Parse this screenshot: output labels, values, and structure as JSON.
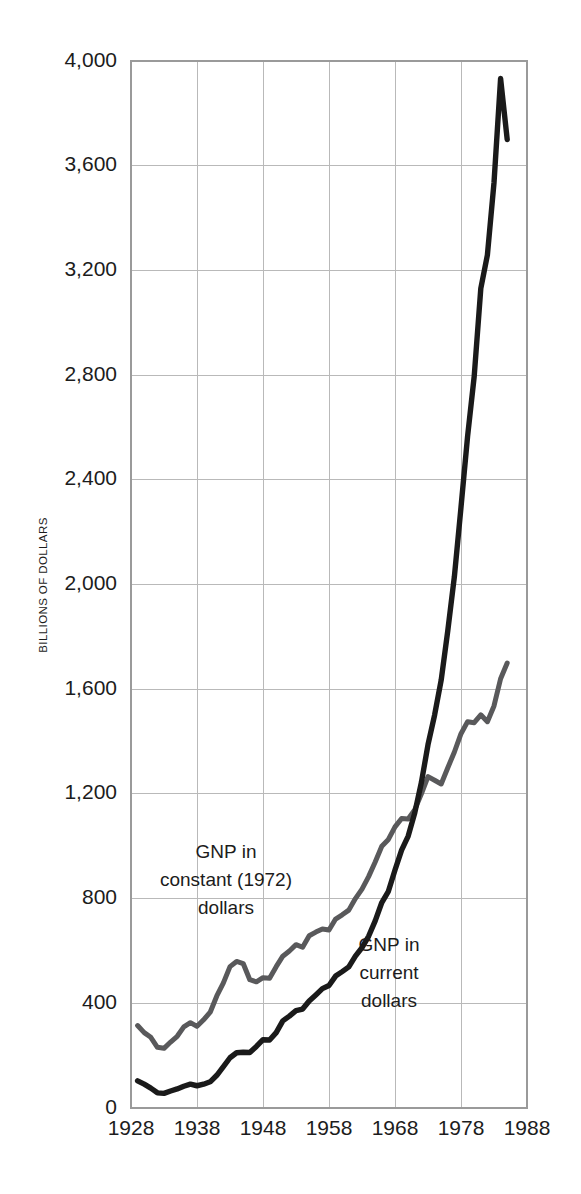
{
  "chart_data": {
    "type": "line",
    "title": "",
    "xlabel": "",
    "ylabel": "BILLIONS OF DOLLARS",
    "xlim": [
      1928,
      1988
    ],
    "ylim": [
      0,
      4000
    ],
    "xticks": [
      1928,
      1938,
      1948,
      1958,
      1968,
      1978,
      1988
    ],
    "xticklabels": [
      "1928",
      "1938",
      "1948",
      "1958",
      "1968",
      "1978",
      "1988"
    ],
    "yticks": [
      0,
      400,
      800,
      1200,
      1600,
      2000,
      2400,
      2800,
      3200,
      3600,
      4000
    ],
    "yticklabels": [
      "0",
      "400",
      "800",
      "1,200",
      "1,600",
      "2,000",
      "2,400",
      "2,800",
      "3,200",
      "3,600",
      "4,000"
    ],
    "grid": true,
    "legend_position": "inline-annotation",
    "series": [
      {
        "name": "GNP in constant (1972) dollars",
        "color": "#59595b",
        "linewidth": 5.0,
        "annotation_lines": [
          "GNP in",
          "constant (1972)",
          "dollars"
        ],
        "x": [
          1929,
          1930,
          1931,
          1932,
          1933,
          1934,
          1935,
          1936,
          1937,
          1938,
          1939,
          1940,
          1941,
          1942,
          1943,
          1944,
          1945,
          1946,
          1947,
          1948,
          1949,
          1950,
          1951,
          1952,
          1953,
          1954,
          1955,
          1956,
          1957,
          1958,
          1959,
          1960,
          1961,
          1962,
          1963,
          1964,
          1965,
          1966,
          1967,
          1968,
          1969,
          1970,
          1971,
          1972,
          1973,
          1974,
          1975,
          1976,
          1977,
          1978,
          1979,
          1980,
          1981,
          1982,
          1983,
          1984,
          1985
        ],
        "values": [
          315,
          288,
          270,
          232,
          228,
          252,
          274,
          310,
          326,
          312,
          337,
          366,
          428,
          478,
          540,
          560,
          552,
          490,
          482,
          498,
          496,
          540,
          580,
          600,
          624,
          614,
          658,
          672,
          684,
          680,
          722,
          738,
          756,
          800,
          836,
          884,
          940,
          1000,
          1026,
          1074,
          1106,
          1104,
          1140,
          1200,
          1266,
          1252,
          1238,
          1300,
          1360,
          1430,
          1476,
          1472,
          1502,
          1476,
          1536,
          1640,
          1700
        ]
      },
      {
        "name": "GNP in current dollars",
        "color": "#1a1a1a",
        "linewidth": 5.4,
        "annotation_lines": [
          "GNP in",
          "current",
          "dollars"
        ],
        "x": [
          1929,
          1930,
          1931,
          1932,
          1933,
          1934,
          1935,
          1936,
          1937,
          1938,
          1939,
          1940,
          1941,
          1942,
          1943,
          1944,
          1945,
          1946,
          1947,
          1948,
          1949,
          1950,
          1951,
          1952,
          1953,
          1954,
          1955,
          1956,
          1957,
          1958,
          1959,
          1960,
          1961,
          1962,
          1963,
          1964,
          1965,
          1966,
          1967,
          1968,
          1969,
          1970,
          1971,
          1972,
          1973,
          1974,
          1975,
          1976,
          1977,
          1978,
          1979,
          1980,
          1981,
          1982,
          1983,
          1984,
          1985
        ],
        "values": [
          104,
          91,
          76,
          58,
          56,
          65,
          73,
          83,
          91,
          85,
          91,
          100,
          125,
          158,
          192,
          211,
          213,
          212,
          235,
          261,
          260,
          288,
          333,
          351,
          372,
          378,
          409,
          432,
          456,
          468,
          504,
          521,
          539,
          580,
          613,
          656,
          715,
          785,
          828,
          909,
          985,
          1039,
          1128,
          1244,
          1388,
          1501,
          1635,
          1824,
          2031,
          2295,
          2566,
          2795,
          3131,
          3259,
          3535,
          3933,
          3700
        ]
      }
    ]
  },
  "annotations": {
    "constant_dollars": {
      "line1": "GNP in",
      "line2": "constant (1972)",
      "line3": "dollars"
    },
    "current_dollars": {
      "line1": "GNP in",
      "line2": "current",
      "line3": "dollars"
    }
  }
}
